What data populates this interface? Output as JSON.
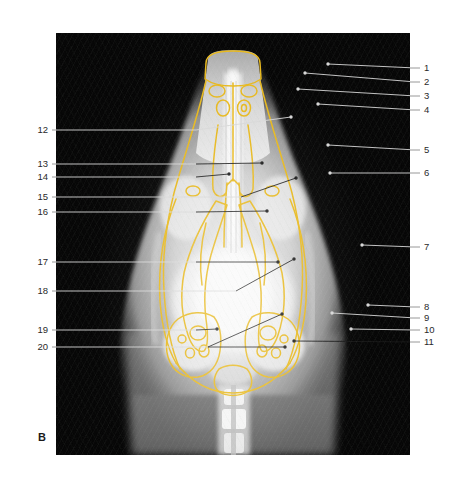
{
  "figure": {
    "panel_letter": "B",
    "modality": "radiograph",
    "view": "dorsoventral skull",
    "orientation_markers": {
      "right": "R",
      "left": "L"
    },
    "overlay_color": "#e8b91e",
    "plate_background": "#030303",
    "leader_line_color_dark_field": "#d8d8d8",
    "leader_line_color_bright_field": "#1a1a1a"
  },
  "labels": {
    "right_column": [
      {
        "number": "1",
        "y": 68,
        "tip_x": 272,
        "tip_y": 64,
        "bend_x": 360
      },
      {
        "number": "2",
        "y": 82,
        "tip_x": 249,
        "tip_y": 73,
        "bend_x": 360
      },
      {
        "number": "3",
        "y": 96,
        "tip_x": 242,
        "tip_y": 89,
        "bend_x": 360
      },
      {
        "number": "4",
        "y": 110,
        "tip_x": 262,
        "tip_y": 104,
        "bend_x": 360
      },
      {
        "number": "5",
        "y": 150,
        "tip_x": 272,
        "tip_y": 145,
        "bend_x": 360
      },
      {
        "number": "6",
        "y": 173,
        "tip_x": 274,
        "tip_y": 173,
        "bend_x": 360
      },
      {
        "number": "7",
        "y": 247,
        "tip_x": 306,
        "tip_y": 245,
        "bend_x": 360
      },
      {
        "number": "8",
        "y": 307,
        "tip_x": 312,
        "tip_y": 305,
        "bend_x": 360
      },
      {
        "number": "9",
        "y": 318,
        "tip_x": 276,
        "tip_y": 313,
        "bend_x": 360
      },
      {
        "number": "10",
        "y": 330,
        "tip_x": 295,
        "tip_y": 329,
        "bend_x": 360
      },
      {
        "number": "11",
        "y": 342,
        "tip_x": 238,
        "tip_y": 341,
        "bend_x": 360
      }
    ],
    "left_column": [
      {
        "number": "12",
        "y": 130,
        "tip_x": 235,
        "tip_y": 117,
        "bend_x": 140
      },
      {
        "number": "13",
        "y": 164,
        "tip_x": 206,
        "tip_y": 163,
        "bend_x": 140
      },
      {
        "number": "14",
        "y": 177,
        "tip_x": 173,
        "tip_y": 174,
        "bend_x": 140
      },
      {
        "number": "15",
        "y": 197,
        "tip_x": 240,
        "tip_y": 178,
        "bend_x": 185
      },
      {
        "number": "16",
        "y": 212,
        "tip_x": 211,
        "tip_y": 211,
        "bend_x": 140
      },
      {
        "number": "17",
        "y": 262,
        "tip_x": 222,
        "tip_y": 262,
        "bend_x": 140
      },
      {
        "number": "18",
        "y": 291,
        "tip_x": 238,
        "tip_y": 259,
        "bend_x": 180
      },
      {
        "number": "19",
        "y": 330,
        "tip_x": 161,
        "tip_y": 329,
        "bend_x": 140
      },
      {
        "number": "20",
        "y": 347,
        "tip_x": 226,
        "tip_y": 314,
        "bend_x": 152,
        "tip2_x": 229,
        "tip2_y": 347
      }
    ]
  }
}
